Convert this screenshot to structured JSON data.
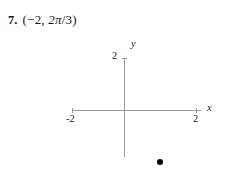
{
  "problem": {
    "number": "7.",
    "open_paren": "(",
    "radius": "−2",
    "comma": ", ",
    "angle_numerator": "2π",
    "angle_slash": "/",
    "angle_denominator": "3",
    "close_paren": ")",
    "expression_full": "(−2, 2π/3)"
  },
  "chart_data": {
    "type": "scatter",
    "title": "",
    "xlabel": "x",
    "ylabel": "y",
    "xlim": [
      -2.5,
      2.5
    ],
    "ylim": [
      -2.5,
      2.5
    ],
    "grid": false,
    "legend": null,
    "x_ticks": [
      -2,
      2
    ],
    "x_tick_labels": [
      "-2",
      "2"
    ],
    "y_ticks": [
      2
    ],
    "y_tick_labels": [
      "2"
    ],
    "points": [
      {
        "x": 1.0,
        "y": -2.0,
        "marker": "filled-circle",
        "color": "#000000"
      }
    ],
    "axis_color": "#9a9a9a"
  }
}
